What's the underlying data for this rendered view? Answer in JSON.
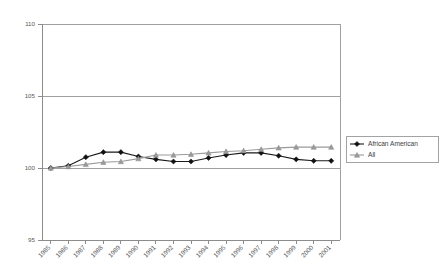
{
  "chart_data": {
    "type": "line",
    "title": "",
    "subtitle": "",
    "xlabel": "",
    "ylabel": "",
    "ylim": [
      95,
      110
    ],
    "y_ticks": [
      95,
      100,
      105,
      110
    ],
    "grid": true,
    "legend_position": "right",
    "categories": [
      "1985",
      "1986",
      "1987",
      "1988",
      "1989",
      "1990",
      "1991",
      "1992",
      "1993",
      "1994",
      "1995",
      "1996",
      "1997",
      "1998",
      "1999",
      "2000",
      "2001"
    ],
    "series": [
      {
        "name": "African American",
        "marker": "diamond",
        "color": "#111111",
        "values": [
          100.0,
          100.15,
          100.75,
          101.1,
          101.1,
          100.8,
          100.6,
          100.45,
          100.45,
          100.7,
          100.9,
          101.05,
          101.05,
          100.85,
          100.6,
          100.5,
          100.5
        ]
      },
      {
        "name": "All",
        "marker": "triangle",
        "color": "#9a9a9a",
        "values": [
          100.0,
          100.1,
          100.25,
          100.4,
          100.45,
          100.65,
          100.9,
          100.9,
          100.95,
          101.05,
          101.15,
          101.2,
          101.3,
          101.4,
          101.45,
          101.45,
          101.45
        ]
      }
    ]
  },
  "legend": {
    "entries": [
      {
        "label": "African American"
      },
      {
        "label": "All"
      }
    ]
  },
  "axes": {
    "y_tick_labels": [
      "110",
      "105",
      "100",
      "95"
    ],
    "x_tick_labels": [
      "1985",
      "1986",
      "1987",
      "1988",
      "1989",
      "1990",
      "1991",
      "1992",
      "1993",
      "1994",
      "1995",
      "1996",
      "1997",
      "1998",
      "1999",
      "2000",
      "2001"
    ]
  }
}
